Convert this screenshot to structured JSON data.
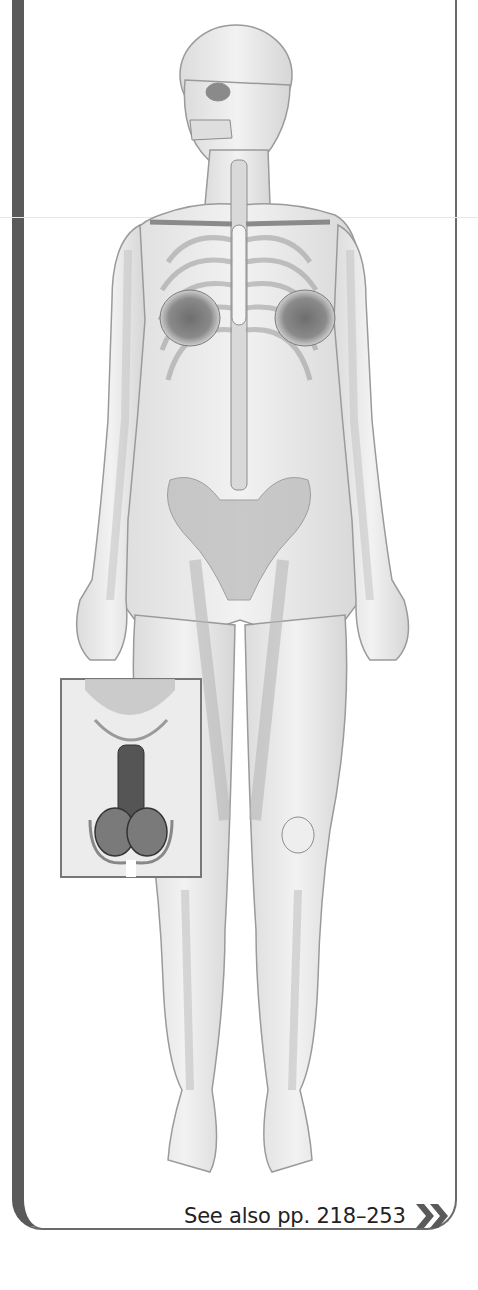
{
  "figure": {
    "inset": {
      "subject": "male reproductive system"
    }
  },
  "footer": {
    "see_also_label": "See also pp. 218–253",
    "see_also_icon": "double-chevron-right-icon",
    "icon_color": "#5a5a5a"
  },
  "colors": {
    "frame_bar": "#5a5a5a",
    "frame_border": "#6a6a6a",
    "text": "#222222"
  }
}
